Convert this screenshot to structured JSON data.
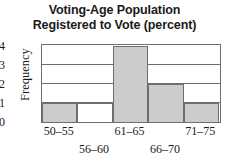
{
  "chart_data": {
    "type": "bar",
    "title": "Voting-Age Population Registered to Vote (percent)",
    "title_lines": [
      "Voting-Age Population",
      "Registered to Vote (percent)"
    ],
    "xlabel": "",
    "ylabel": "Frequency",
    "categories": [
      "50–55",
      "56–60",
      "61–65",
      "66–70",
      "71–75"
    ],
    "values": [
      1,
      0,
      4,
      2,
      1
    ],
    "bar_styles": [
      "filled",
      "empty",
      "filled",
      "filled",
      "filled"
    ],
    "ylim": [
      0,
      4
    ],
    "yticks": [
      "0",
      "1",
      "2",
      "3",
      "4"
    ],
    "grid": "horizontal",
    "legend": "none",
    "colors": {
      "bar_fill": "#cccccc",
      "bar_empty": "#ffffff",
      "outline": "#6e6e6e",
      "text": "#1a1a1a",
      "background": "#ffffff"
    }
  }
}
